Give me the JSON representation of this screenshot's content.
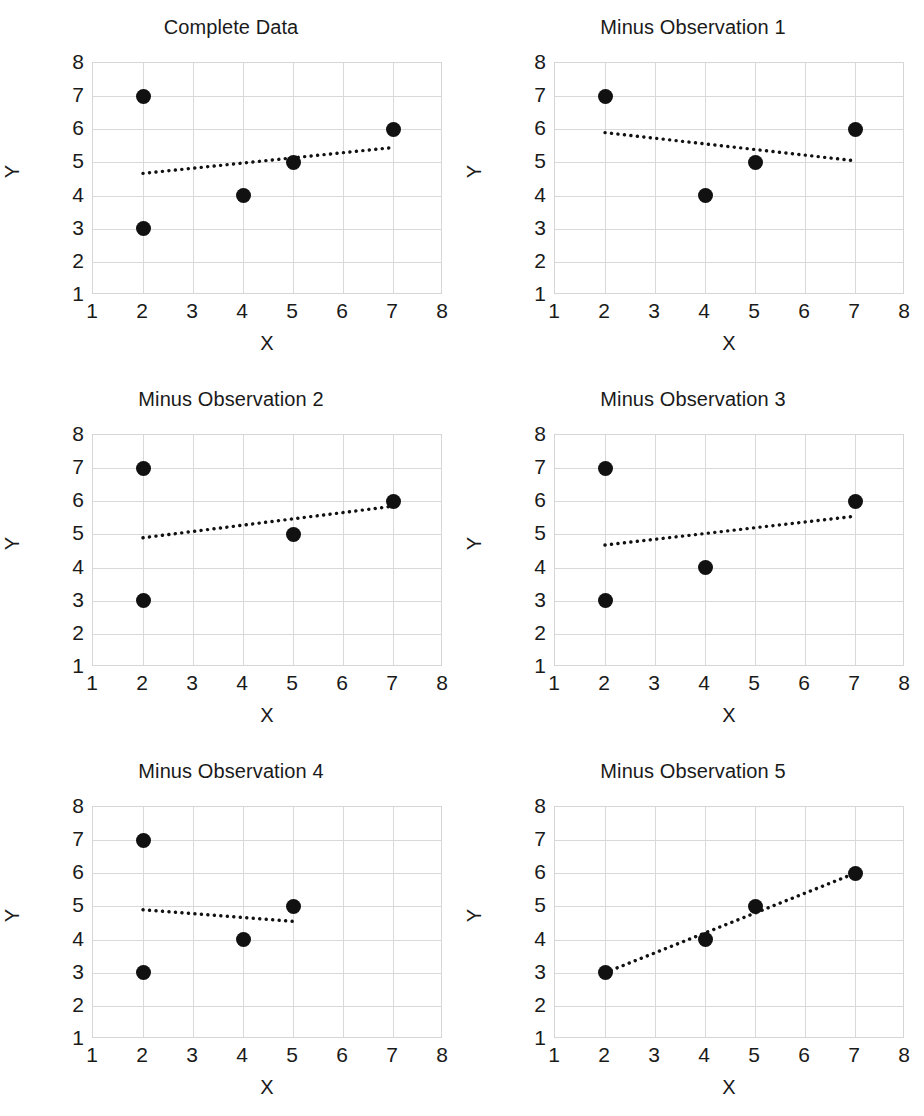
{
  "figure": {
    "axis_label_x": "X",
    "axis_label_y": "Y",
    "x_ticks": [
      "1",
      "2",
      "3",
      "4",
      "5",
      "6",
      "7",
      "8"
    ],
    "y_ticks": [
      "8",
      "7",
      "6",
      "5",
      "4",
      "3",
      "2",
      "1"
    ]
  },
  "chart_data": [
    {
      "type": "scatter",
      "title": "Complete Data",
      "xlabel": "X",
      "ylabel": "Y",
      "xlim": [
        1,
        8
      ],
      "ylim": [
        1,
        8
      ],
      "xticks": [
        1,
        2,
        3,
        4,
        5,
        6,
        7,
        8
      ],
      "yticks": [
        1,
        2,
        3,
        4,
        5,
        6,
        7,
        8
      ],
      "grid": true,
      "legend": "none",
      "points": [
        {
          "x": 2,
          "y": 7
        },
        {
          "x": 2,
          "y": 3
        },
        {
          "x": 4,
          "y": 4
        },
        {
          "x": 5,
          "y": 5
        },
        {
          "x": 7,
          "y": 6
        }
      ],
      "trendline": {
        "style": "dotted",
        "x0": 2,
        "y0": 4.67,
        "x1": 7,
        "y1": 5.45
      }
    },
    {
      "type": "scatter",
      "title": "Minus Observation 1",
      "xlabel": "X",
      "ylabel": "Y",
      "xlim": [
        1,
        8
      ],
      "ylim": [
        1,
        8
      ],
      "xticks": [
        1,
        2,
        3,
        4,
        5,
        6,
        7,
        8
      ],
      "yticks": [
        1,
        2,
        3,
        4,
        5,
        6,
        7,
        8
      ],
      "grid": true,
      "legend": "none",
      "points": [
        {
          "x": 2,
          "y": 7
        },
        {
          "x": 4,
          "y": 4
        },
        {
          "x": 5,
          "y": 5
        },
        {
          "x": 7,
          "y": 6
        }
      ],
      "trendline": {
        "style": "dotted",
        "x0": 2,
        "y0": 5.9,
        "x1": 7,
        "y1": 5.05
      }
    },
    {
      "type": "scatter",
      "title": "Minus Observation 2",
      "xlabel": "X",
      "ylabel": "Y",
      "xlim": [
        1,
        8
      ],
      "ylim": [
        1,
        8
      ],
      "xticks": [
        1,
        2,
        3,
        4,
        5,
        6,
        7,
        8
      ],
      "yticks": [
        1,
        2,
        3,
        4,
        5,
        6,
        7,
        8
      ],
      "grid": true,
      "legend": "none",
      "points": [
        {
          "x": 2,
          "y": 7
        },
        {
          "x": 2,
          "y": 3
        },
        {
          "x": 5,
          "y": 5
        },
        {
          "x": 7,
          "y": 6
        }
      ],
      "trendline": {
        "style": "dotted",
        "x0": 2,
        "y0": 4.9,
        "x1": 7,
        "y1": 5.85
      }
    },
    {
      "type": "scatter",
      "title": "Minus Observation 3",
      "xlabel": "X",
      "ylabel": "Y",
      "xlim": [
        1,
        8
      ],
      "ylim": [
        1,
        8
      ],
      "xticks": [
        1,
        2,
        3,
        4,
        5,
        6,
        7,
        8
      ],
      "yticks": [
        1,
        2,
        3,
        4,
        5,
        6,
        7,
        8
      ],
      "grid": true,
      "legend": "none",
      "points": [
        {
          "x": 2,
          "y": 7
        },
        {
          "x": 2,
          "y": 3
        },
        {
          "x": 4,
          "y": 4
        },
        {
          "x": 7,
          "y": 6
        }
      ],
      "trendline": {
        "style": "dotted",
        "x0": 2,
        "y0": 4.68,
        "x1": 7,
        "y1": 5.55
      }
    },
    {
      "type": "scatter",
      "title": "Minus Observation 4",
      "xlabel": "X",
      "ylabel": "Y",
      "xlim": [
        1,
        8
      ],
      "ylim": [
        1,
        8
      ],
      "xticks": [
        1,
        2,
        3,
        4,
        5,
        6,
        7,
        8
      ],
      "yticks": [
        1,
        2,
        3,
        4,
        5,
        6,
        7,
        8
      ],
      "grid": true,
      "legend": "none",
      "points": [
        {
          "x": 2,
          "y": 7
        },
        {
          "x": 2,
          "y": 3
        },
        {
          "x": 4,
          "y": 4
        },
        {
          "x": 5,
          "y": 5
        }
      ],
      "trendline": {
        "style": "dotted",
        "x0": 2,
        "y0": 4.9,
        "x1": 5,
        "y1": 4.55
      }
    },
    {
      "type": "scatter",
      "title": "Minus Observation 5",
      "xlabel": "X",
      "ylabel": "Y",
      "xlim": [
        1,
        8
      ],
      "ylim": [
        1,
        8
      ],
      "xticks": [
        1,
        2,
        3,
        4,
        5,
        6,
        7,
        8
      ],
      "yticks": [
        1,
        2,
        3,
        4,
        5,
        6,
        7,
        8
      ],
      "grid": true,
      "legend": "none",
      "points": [
        {
          "x": 2,
          "y": 3
        },
        {
          "x": 4,
          "y": 4
        },
        {
          "x": 5,
          "y": 5
        },
        {
          "x": 7,
          "y": 6
        }
      ],
      "trendline": {
        "style": "dotted",
        "x0": 2,
        "y0": 3.0,
        "x1": 7,
        "y1": 6.0
      }
    }
  ],
  "colors": {
    "marker": "#111111",
    "gridline": "#d9d9d9",
    "frame": "#d6d6d6",
    "text": "#1a1a1a",
    "background": "#ffffff"
  }
}
